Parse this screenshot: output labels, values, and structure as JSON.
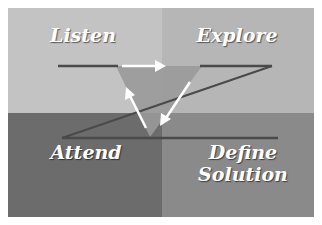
{
  "diagram": {
    "quadrants": [
      {
        "id": "top-left",
        "label": "Listen",
        "color": "#c3c3c3"
      },
      {
        "id": "top-right",
        "label": "Explore",
        "color": "#b6b6b6"
      },
      {
        "id": "bottom-left",
        "label": "Attend",
        "color": "#6c6c6c"
      },
      {
        "id": "bottom-right",
        "label": "Define Solution",
        "label_line1": "Define",
        "label_line2": "Solution",
        "color": "#8a8a8a"
      }
    ],
    "center_triangle": {
      "color": "#9a9a9a",
      "arrow_color": "#ffffff"
    },
    "line_color": "#4a4a4a",
    "text_color": "#ffffff"
  }
}
